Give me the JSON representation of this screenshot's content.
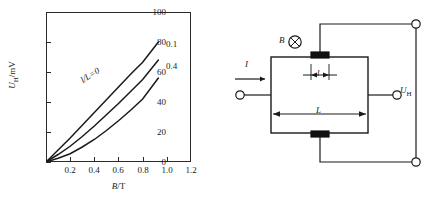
{
  "figure": {
    "panels": [
      "hall-voltage-chart",
      "hall-device-circuit"
    ]
  },
  "chart_data": {
    "type": "line",
    "title": "",
    "xlabel": "B/T",
    "ylabel": "U_H/mV",
    "xlabel_var": "B",
    "xlabel_unit": "/T",
    "ylabel_var": "U",
    "ylabel_sub": "H",
    "ylabel_unit": "/mV",
    "xlim": [
      0,
      1.2
    ],
    "ylim": [
      0,
      100
    ],
    "xticks": [
      0.2,
      0.4,
      0.6,
      0.8,
      1.0,
      1.2
    ],
    "xtick_labels": [
      "0.2",
      "0.4",
      "0.6",
      "0.8",
      "1.0",
      "1.2"
    ],
    "yticks": [
      0,
      20,
      40,
      60,
      80,
      100
    ],
    "ytick_labels": [
      "0",
      "20",
      "40",
      "60",
      "80",
      "100"
    ],
    "grid": false,
    "legend": "inline-curve-labels",
    "series": [
      {
        "name": "l/L=0",
        "label": "l/L=0",
        "label_rotated": true,
        "points": [
          [
            0,
            0
          ],
          [
            0.1,
            8
          ],
          [
            0.2,
            16
          ],
          [
            0.3,
            24.5
          ],
          [
            0.4,
            33
          ],
          [
            0.5,
            41.5
          ],
          [
            0.6,
            50
          ],
          [
            0.7,
            58.5
          ],
          [
            0.8,
            66.5
          ],
          [
            0.93,
            80
          ]
        ]
      },
      {
        "name": "0.1",
        "label": "0.1",
        "label_rotated": false,
        "points": [
          [
            0,
            0
          ],
          [
            0.1,
            5
          ],
          [
            0.2,
            10.5
          ],
          [
            0.3,
            17
          ],
          [
            0.4,
            24
          ],
          [
            0.5,
            31.5
          ],
          [
            0.6,
            39
          ],
          [
            0.7,
            47
          ],
          [
            0.8,
            55
          ],
          [
            0.93,
            68
          ]
        ]
      },
      {
        "name": "0.4",
        "label": "0.4",
        "label_rotated": false,
        "points": [
          [
            0,
            0
          ],
          [
            0.1,
            2.5
          ],
          [
            0.2,
            5.5
          ],
          [
            0.3,
            10
          ],
          [
            0.4,
            15
          ],
          [
            0.5,
            21
          ],
          [
            0.6,
            27.5
          ],
          [
            0.7,
            34.5
          ],
          [
            0.8,
            42
          ],
          [
            0.93,
            56
          ]
        ]
      }
    ]
  },
  "circuit": {
    "name": "hall-effect-device",
    "labels": {
      "magnetic_field": "B",
      "magnetic_field_symbol": "crossed-circle-icon",
      "current": "I",
      "small_length": "l",
      "large_length": "L",
      "hall_voltage_var": "U",
      "hall_voltage_sub": "H"
    },
    "terminals": [
      "input-current-terminal",
      "output-current-terminal",
      "hall-voltage-top-terminal",
      "hall-voltage-bottom-terminal"
    ],
    "electrodes": [
      "top-electrode",
      "bottom-electrode"
    ]
  }
}
